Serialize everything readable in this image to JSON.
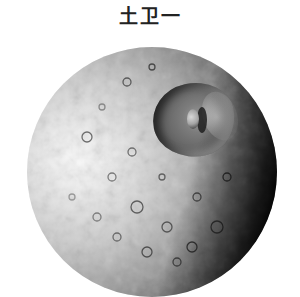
{
  "title": "土卫一",
  "image": {
    "subject": "Mimas, moon of Saturn",
    "description": "Grayscale photograph of a heavily cratered spherical moon with a large crater (Herschel) in the upper right; the right limb falls into shadow",
    "colors": {
      "background": "#ffffff",
      "lit_surface": "#e6e6e6",
      "mid_surface": "#9a9a9a",
      "shadow": "#050505",
      "title_text": "#222222"
    }
  }
}
